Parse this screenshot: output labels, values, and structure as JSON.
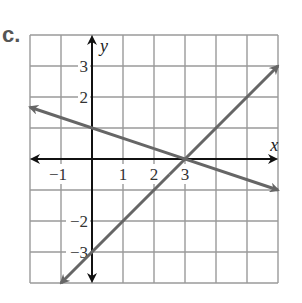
{
  "problem_label": "c.",
  "chart_data": {
    "type": "line",
    "title": "",
    "xlabel": "x",
    "ylabel": "y",
    "xlim": [
      -2,
      6
    ],
    "ylim": [
      -4,
      4
    ],
    "grid": true,
    "x_tick_labels": [
      "−1",
      "1",
      "2",
      "3"
    ],
    "y_tick_labels": [
      "3",
      "2",
      "−2",
      "−3"
    ],
    "series": [
      {
        "name": "line 1",
        "equation": "y = -x/3 + 1",
        "points": [
          [
            -2,
            1.67
          ],
          [
            0,
            1
          ],
          [
            3,
            0
          ],
          [
            6,
            -1
          ]
        ],
        "color": "#666666"
      },
      {
        "name": "line 2",
        "equation": "y = x - 3",
        "points": [
          [
            -1,
            -4
          ],
          [
            0,
            -3
          ],
          [
            3,
            0
          ],
          [
            6,
            3
          ]
        ],
        "color": "#666666"
      }
    ],
    "intersection": [
      3,
      0
    ]
  }
}
